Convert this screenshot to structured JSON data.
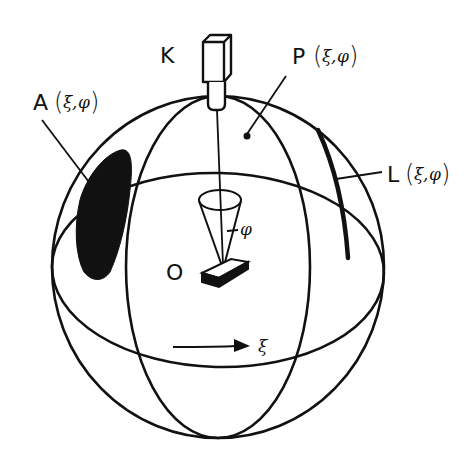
{
  "diagram": {
    "colors": {
      "ink": "#111111",
      "background": "#ffffff"
    },
    "labels": {
      "camera": "K",
      "point": "P",
      "area": "A",
      "line": "L",
      "origin": "O",
      "coords_open": "(",
      "xi": "ξ",
      "comma": ",",
      "phi": "φ",
      "coords_close": ")",
      "rotation_symbol": "ξ",
      "cone_angle_symbol": "φ"
    },
    "elements": [
      {
        "id": "camera",
        "label": "K"
      },
      {
        "id": "point-p",
        "label": "P (ξ,φ)"
      },
      {
        "id": "area-a",
        "label": "A (ξ,φ)"
      },
      {
        "id": "line-l",
        "label": "L (ξ,φ)"
      },
      {
        "id": "sample",
        "label": "O"
      },
      {
        "id": "rotation-arrow",
        "label": "ξ"
      },
      {
        "id": "cone",
        "label": "φ"
      }
    ]
  }
}
